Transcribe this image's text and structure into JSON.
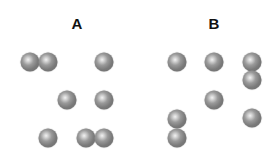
{
  "panels": [
    {
      "label": "A",
      "label_pos": [
        77,
        23
      ],
      "balls": [
        [
          30,
          62
        ],
        [
          48,
          62
        ],
        [
          104,
          62
        ],
        [
          67,
          100
        ],
        [
          104,
          100
        ],
        [
          48,
          138
        ],
        [
          86,
          138
        ],
        [
          104,
          138
        ]
      ]
    },
    {
      "label": "B",
      "label_pos": [
        214,
        23
      ],
      "balls": [
        [
          177,
          62
        ],
        [
          214,
          62
        ],
        [
          252,
          62
        ],
        [
          252,
          80
        ],
        [
          214,
          100
        ],
        [
          177,
          119
        ],
        [
          252,
          118
        ],
        [
          177,
          138
        ]
      ]
    }
  ],
  "colors": {
    "ball": "#7a7a7a",
    "label": "#111111",
    "background": "#ffffff"
  }
}
